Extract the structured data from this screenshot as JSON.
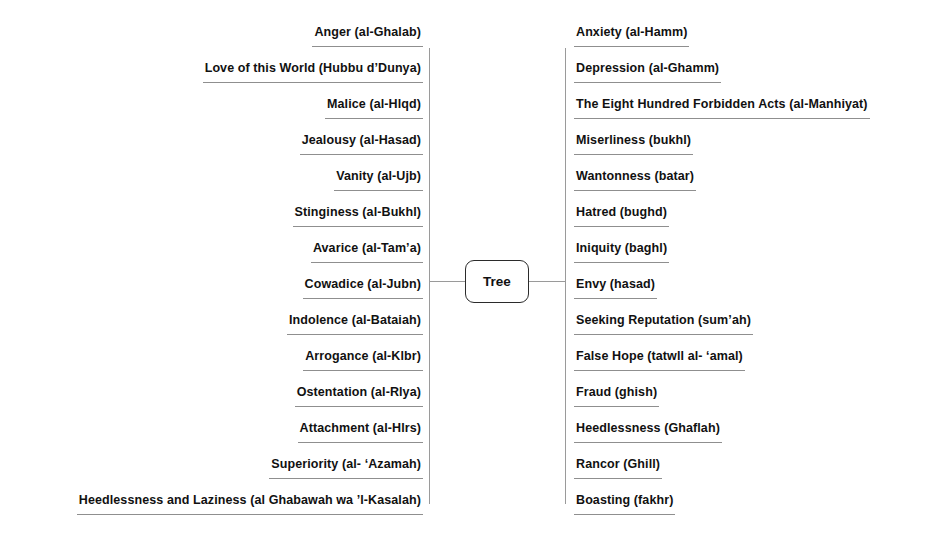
{
  "diagram": {
    "center_node": {
      "label": "Tree",
      "shape": "rounded-rectangle"
    },
    "colors": {
      "background": "#ffffff",
      "text": "#111111",
      "line": "#9a9a9a",
      "node_border": "#2b2b2b"
    },
    "left_branches": [
      {
        "label": "Anger (al-Ghalab)"
      },
      {
        "label": "Love of this World (Hubbu d’Dunya)"
      },
      {
        "label": "Malice (al-Hlqd)"
      },
      {
        "label": "Jealousy (al-Hasad)"
      },
      {
        "label": "Vanity (al-Ujb)"
      },
      {
        "label": "Stinginess (al-Bukhl)"
      },
      {
        "label": "Avarice (al-Tam’a)"
      },
      {
        "label": "Cowadice (al-Jubn)"
      },
      {
        "label": "Indolence (al-Bataiah)"
      },
      {
        "label": "Arrogance (al-Klbr)"
      },
      {
        "label": "Ostentation (al-Rlya)"
      },
      {
        "label": "Attachment (al-Hlrs)"
      },
      {
        "label": "Superiority (al- ‘Azamah)"
      },
      {
        "label": "Heedlessness and Laziness (al Ghabawah wa ’l-Kasalah)"
      }
    ],
    "right_branches": [
      {
        "label": "Anxiety (al-Hamm)"
      },
      {
        "label": "Depression (al-Ghamm)"
      },
      {
        "label": "The Eight Hundred Forbidden Acts (al-Manhiyat)"
      },
      {
        "label": "Miserliness (bukhl)"
      },
      {
        "label": "Wantonness (batar)"
      },
      {
        "label": "Hatred (bughd)"
      },
      {
        "label": "Iniquity (baghl)"
      },
      {
        "label": "Envy (hasad)"
      },
      {
        "label": "Seeking Reputation (sum’ah)"
      },
      {
        "label": "False Hope (tatwll al- ‘amal)"
      },
      {
        "label": "Fraud (ghish)"
      },
      {
        "label": "Heedlessness (Ghaflah)"
      },
      {
        "label": "Rancor (Ghill)"
      },
      {
        "label": "Boasting (fakhr)"
      }
    ]
  }
}
